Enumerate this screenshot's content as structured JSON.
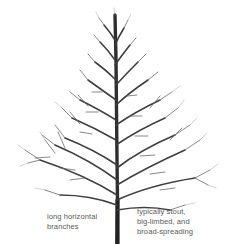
{
  "illustration": {
    "subject": "bare deciduous tree silhouette",
    "trunk_color": "#2e2e2e",
    "branch_color": "#4a4a4a",
    "twig_color": "#8a8a8a"
  },
  "annotations": {
    "left": {
      "line1": "long horizontal",
      "line2": "branches"
    },
    "right": {
      "line1": "typically stout,",
      "line2": "big-limbed, and",
      "line3": "broad-spreading"
    }
  }
}
